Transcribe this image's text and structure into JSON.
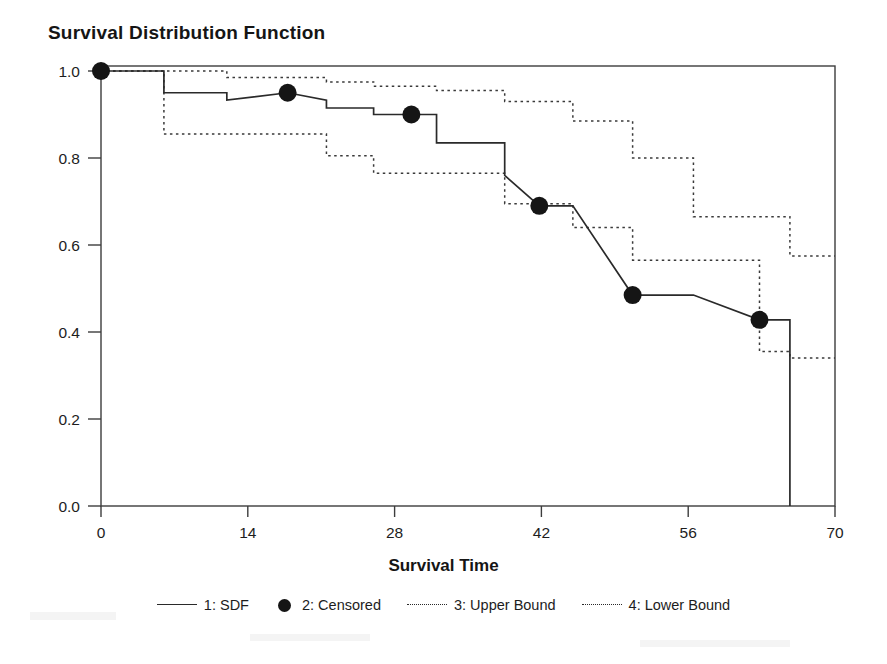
{
  "chart_data": {
    "type": "line",
    "title": "Survival Distribution Function",
    "xlabel": "Survival Time",
    "ylabel": "",
    "xlim": [
      0,
      70
    ],
    "ylim": [
      0.0,
      1.0
    ],
    "grid": false,
    "legend_position": "bottom",
    "xticks": [
      "0",
      "14",
      "28",
      "42",
      "56",
      "70"
    ],
    "xtick_values": [
      0,
      14,
      28,
      42,
      56,
      70
    ],
    "yticks": [
      "0.0",
      "0.2",
      "0.4",
      "0.6",
      "0.8",
      "1.0"
    ],
    "ytick_values": [
      0.0,
      0.2,
      0.4,
      0.6,
      0.8,
      1.0
    ],
    "series": [
      {
        "name": "1: SDF",
        "style": "solid",
        "step": "post",
        "x": [
          0,
          6,
          6,
          12,
          12,
          17.8,
          21.5,
          21.5,
          26,
          26,
          29.6,
          32,
          32,
          38.5,
          38.5,
          41.8,
          45,
          45,
          50.7,
          56.5,
          56.5,
          62.8,
          65.7,
          65.7
        ],
        "y": [
          1.0,
          1.0,
          0.95,
          0.95,
          0.933,
          0.95,
          0.933,
          0.915,
          0.915,
          0.9,
          0.9,
          0.9,
          0.835,
          0.835,
          0.76,
          0.69,
          0.69,
          0.69,
          0.485,
          0.485,
          0.485,
          0.428,
          0.428,
          0.0
        ]
      },
      {
        "name": "3: Upper Bound",
        "style": "dotted",
        "step": "post",
        "x": [
          0,
          6,
          12,
          21.5,
          26,
          32,
          38.5,
          45,
          50.7,
          56.5,
          62.8,
          65.7,
          70
        ],
        "y": [
          1.0,
          1.0,
          0.985,
          0.975,
          0.965,
          0.955,
          0.93,
          0.885,
          0.8,
          0.665,
          0.665,
          0.575,
          0.575
        ]
      },
      {
        "name": "4: Lower Bound",
        "style": "dotted",
        "step": "post",
        "x": [
          0,
          6,
          12,
          21.5,
          26,
          32,
          38.5,
          45,
          50.7,
          56.5,
          62.8,
          65.7,
          70
        ],
        "y": [
          1.0,
          0.855,
          0.855,
          0.805,
          0.765,
          0.765,
          0.695,
          0.64,
          0.565,
          0.565,
          0.355,
          0.34,
          0.34
        ]
      }
    ],
    "censored_points": {
      "name": "2: Censored",
      "x": [
        0,
        17.8,
        29.6,
        41.8,
        50.7,
        62.8
      ],
      "y": [
        1.0,
        0.95,
        0.9,
        0.69,
        0.485,
        0.428
      ]
    },
    "colors": {
      "sdf": "#2a2a2a",
      "bounds": "#3a3a3a",
      "censored": "#151515",
      "axis": "#3d3d3d",
      "background": "#ffffff"
    }
  },
  "legend": {
    "entries": [
      {
        "label": "1: SDF",
        "style": "solid"
      },
      {
        "label": "2: Censored",
        "style": "marker"
      },
      {
        "label": "3: Upper Bound",
        "style": "dotted"
      },
      {
        "label": "4: Lower Bound",
        "style": "dotted"
      }
    ]
  }
}
